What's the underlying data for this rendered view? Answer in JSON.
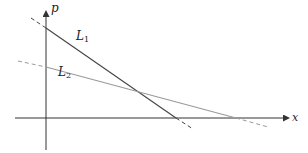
{
  "diagram": {
    "type": "supply-demand-style line intersection",
    "axes": {
      "vertical_label": "p",
      "horizontal_label": "x"
    },
    "lines": [
      {
        "name": "L",
        "subscript": "1",
        "style": "solid with dashed extensions",
        "color": "#444444",
        "slope": "steep negative"
      },
      {
        "name": "L",
        "subscript": "2",
        "style": "solid with dashed extensions",
        "color": "#9a9a9a",
        "slope": "shallow negative"
      }
    ],
    "intersection": "L1 and L2 intersect in the first quadrant"
  },
  "labels": {
    "p": "p",
    "x": "x",
    "l1_main": "L",
    "l1_sub": "1",
    "l2_main": "L",
    "l2_sub": "2"
  },
  "colors": {
    "axis": "#333333",
    "l1": "#444444",
    "l2": "#9a9a9a",
    "background": "#ffffff"
  }
}
